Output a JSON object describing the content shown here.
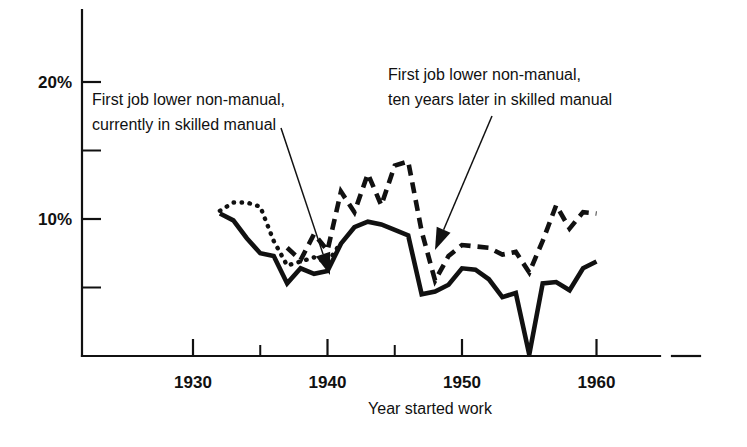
{
  "chart_data": {
    "type": "line",
    "title": "",
    "xlabel": "Year started work",
    "ylabel": "",
    "xlim": [
      1925,
      1965
    ],
    "ylim": [
      0,
      22.5
    ],
    "grid": false,
    "legend_position": "annotations-inline",
    "x_ticks_major": [
      1930,
      1940,
      1950,
      1960
    ],
    "x_ticks_major_labels": [
      "1930",
      "1940",
      "1950",
      "1960"
    ],
    "x_ticks_minor": [
      1935,
      1945,
      1955
    ],
    "y_ticks_major": [
      10,
      20
    ],
    "y_ticks_major_labels": [
      "10%",
      "20%"
    ],
    "y_ticks_minor": [
      5,
      15
    ],
    "series": [
      {
        "name": "First job lower non-manual, currently in skilled manual",
        "style": "solid",
        "x": [
          1932,
          1933,
          1934,
          1935,
          1936,
          1937,
          1938,
          1939,
          1940,
          1941,
          1942,
          1943,
          1944,
          1945,
          1946,
          1947,
          1948,
          1949,
          1950,
          1951,
          1952,
          1953,
          1954,
          1955,
          1956,
          1957,
          1958,
          1959,
          1960
        ],
        "values": [
          10.4,
          9.9,
          8.6,
          7.5,
          7.3,
          5.3,
          6.4,
          6.0,
          6.2,
          8.2,
          9.4,
          9.8,
          9.6,
          9.2,
          8.8,
          4.5,
          4.7,
          5.2,
          6.4,
          6.3,
          5.6,
          4.3,
          4.6,
          0.1,
          5.3,
          5.4,
          4.8,
          6.4,
          6.9
        ]
      },
      {
        "name": "First job lower non-manual, ten years later in skilled manual",
        "style": "dashed",
        "x": [
          1937,
          1938,
          1939,
          1940,
          1941,
          1942,
          1943,
          1944,
          1945,
          1946,
          1947,
          1948,
          1949,
          1950,
          1951,
          1952,
          1953,
          1954,
          1955,
          1956,
          1957,
          1958,
          1959,
          1960
        ],
        "values": [
          7.9,
          7.0,
          8.9,
          7.7,
          12.0,
          10.5,
          13.3,
          11.0,
          13.9,
          14.2,
          9.1,
          5.5,
          7.3,
          8.1,
          8.0,
          7.9,
          7.4,
          7.6,
          6.1,
          8.4,
          11.0,
          9.3,
          10.5,
          10.4
        ]
      },
      {
        "name": "dotted early segment",
        "style": "dotted",
        "x": [
          1932,
          1933,
          1934,
          1935,
          1936,
          1937,
          1938,
          1939,
          1940,
          1941
        ],
        "values": [
          10.6,
          11.2,
          11.2,
          10.9,
          8.4,
          6.6,
          6.9,
          7.2,
          6.8,
          8.3
        ]
      }
    ],
    "annotations": [
      {
        "id": "annotation-left",
        "lines": [
          "First job lower non-manual,",
          "currently in skilled manual"
        ],
        "text_x": 92,
        "text_y": 105,
        "leader_from": [
          281,
          128
        ],
        "leader_to": [
          330,
          275
        ]
      },
      {
        "id": "annotation-right",
        "lines": [
          "First job lower non-manual,",
          "ten years later in skilled manual"
        ],
        "text_x": 388,
        "text_y": 80,
        "leader_from": [
          492,
          116
        ],
        "leader_to": [
          435,
          250
        ]
      }
    ]
  },
  "geometry": {
    "plot_left": 82,
    "plot_bottom": 356,
    "plot_top": 10,
    "axis_right": 700,
    "x_per_year": 13.45,
    "x_origin_year": 1930,
    "x_origin_px": 193,
    "y_per_percent": 13.7,
    "y_zero_px": 356
  }
}
